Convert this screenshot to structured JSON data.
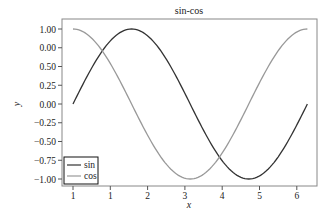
{
  "chart_data": {
    "type": "line",
    "title": "sin-cos",
    "xlabel": "x",
    "ylabel": "y",
    "xlim": [
      -0.3,
      6.6
    ],
    "ylim": [
      -1.1,
      1.1
    ],
    "grid": false,
    "legend_position": "lower left",
    "x_ticks": [
      {
        "value": 0,
        "label": "1"
      },
      {
        "value": 1,
        "label": "1"
      },
      {
        "value": 2,
        "label": "2"
      },
      {
        "value": 3,
        "label": "3"
      },
      {
        "value": 4,
        "label": "4"
      },
      {
        "value": 5,
        "label": "5"
      },
      {
        "value": 6,
        "label": "6"
      }
    ],
    "y_ticks": [
      {
        "value": 1.0,
        "label": "1.00"
      },
      {
        "value": 0.75,
        "label": "0.00"
      },
      {
        "value": 0.5,
        "label": "0.50"
      },
      {
        "value": 0.25,
        "label": "0.25"
      },
      {
        "value": 0.0,
        "label": "0.00"
      },
      {
        "value": -0.25,
        "label": "−0.25"
      },
      {
        "value": -0.5,
        "label": "−0.50"
      },
      {
        "value": -0.75,
        "label": "−0.75"
      },
      {
        "value": -1.0,
        "label": "−1.00"
      }
    ],
    "series": [
      {
        "name": "sin",
        "color": "#333333",
        "function": "sin(x)",
        "x": [
          0,
          0.5,
          1.0,
          1.5708,
          2.0,
          2.5,
          3.1416,
          3.5,
          4.0,
          4.7124,
          5.0,
          5.5,
          6.2832
        ],
        "values": [
          0.0,
          0.479,
          0.841,
          1.0,
          0.909,
          0.598,
          0.0,
          -0.351,
          -0.757,
          -1.0,
          -0.959,
          -0.706,
          0.0
        ]
      },
      {
        "name": "cos",
        "color": "#999999",
        "function": "cos(x)",
        "x": [
          0,
          0.5,
          1.0,
          1.5708,
          2.0,
          2.5,
          3.1416,
          3.5,
          4.0,
          4.7124,
          5.0,
          5.5,
          6.2832
        ],
        "values": [
          1.0,
          0.878,
          0.54,
          0.0,
          -0.416,
          -0.801,
          -1.0,
          -0.936,
          -0.654,
          0.0,
          0.284,
          0.709,
          1.0
        ]
      }
    ]
  },
  "chart": {
    "title": "sin-cos",
    "xlabel": "x",
    "ylabel": "y",
    "legend": [
      {
        "label": "sin",
        "color": "#333333"
      },
      {
        "label": "cos",
        "color": "#999999"
      }
    ]
  }
}
